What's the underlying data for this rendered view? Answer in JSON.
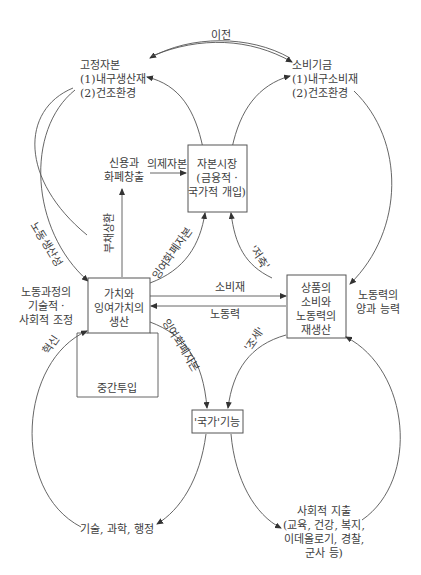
{
  "diagram": {
    "title_fragment": "",
    "nodes": {
      "fixed_capital": {
        "lines": [
          "고정자본",
          "(1)내구생산재",
          "(2)건조환경"
        ]
      },
      "consumption_fund": {
        "lines": [
          "소비기금",
          "(1)내구소비재",
          "(2)건조환경"
        ]
      },
      "credit_money": {
        "lines": [
          "신용과",
          "화폐창출"
        ]
      },
      "capital_market": {
        "lines": [
          "자본시장",
          "(금융적 ·",
          "국가적 개입)"
        ]
      },
      "value_production": {
        "lines": [
          "가치와",
          "잉여가치의",
          "생산"
        ]
      },
      "commodity_consumption": {
        "lines": [
          "상품의",
          "소비와",
          "노동력의",
          "재생산"
        ]
      },
      "intermediate_inputs": {
        "label": "중간투입"
      },
      "state_function": {
        "label": "'국가'기능"
      },
      "tech_science_admin": {
        "label": "기술, 과학, 행정"
      },
      "social_expenditure": {
        "lines": [
          "사회적 지출",
          "(교육, 건강, 복지,",
          "이데올로기, 경찰,",
          "군사 등)"
        ]
      },
      "labor_process": {
        "lines": [
          "노동과정의",
          "기술적 ·",
          "사회적 조정"
        ]
      },
      "labor_quantity": {
        "lines": [
          "노동력의",
          "양과 능력"
        ]
      }
    },
    "edges": {
      "transfer": "이전",
      "fictitious_capital": "의제자본",
      "debt_repayment": "부채상환",
      "surplus_money_capital_up": "잉여화폐자본",
      "savings": "'저축'",
      "labor_productivity": "노동생산성",
      "consumer_goods": "소비재",
      "labor_power": "노동력",
      "surplus_money_capital_down": "잉여화폐자본",
      "taxes": "'조세'",
      "innovation": "혁신"
    }
  }
}
